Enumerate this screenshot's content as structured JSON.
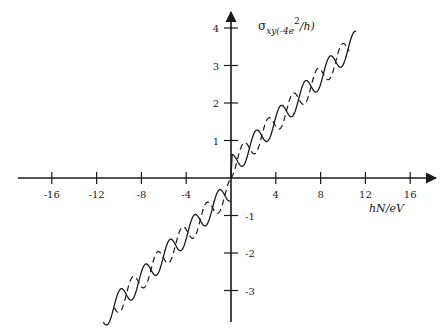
{
  "chart_data": {
    "type": "line",
    "title": "",
    "xlabel": "hN/eV",
    "ylabel": "σxy(-4e²/h)",
    "ylabel_parts": {
      "sigma": "σ",
      "sub": "xy(-4e",
      "sup": "2",
      "tail": "/h)"
    },
    "xlim": [
      -19,
      19
    ],
    "ylim": [
      -3.5,
      4.3
    ],
    "x_ticks": [
      -16,
      -12,
      -8,
      -4,
      4,
      8,
      12,
      16
    ],
    "x_tick_labels": [
      "-16",
      "-12",
      "-8",
      "-4",
      "4",
      "8",
      "12",
      "16"
    ],
    "y_ticks": [
      -3,
      -2,
      -1,
      1,
      2,
      3,
      4
    ],
    "y_tick_labels": [
      "-3",
      "-2",
      "-1",
      "1",
      "2",
      "3",
      "4"
    ],
    "grid": false,
    "legend": null,
    "series": [
      {
        "name": "solid",
        "style": "solid",
        "description": "Oscillating curve rising roughly linearly with slope ~0.33 per unit hN/eV, oscillation amplitude ~0.3, period ~2.2 units; odd-symmetric about origin; jumps from 0 to ~0.6 at origin then oscillates up to ~3.1 at x≈11, and down to ~-3.0 at x≈-11",
        "x": [
          0,
          0.5,
          1.5,
          2.6,
          3.7,
          4.8,
          5.9,
          7.0,
          8.1,
          9.2,
          10.3,
          11.2
        ],
        "y": [
          0.6,
          0.5,
          0.35,
          1.05,
          0.9,
          1.65,
          1.5,
          2.2,
          2.05,
          2.8,
          2.6,
          3.1
        ]
      },
      {
        "name": "dashed",
        "style": "dashed",
        "description": "Oscillating curve phase-shifted relative to the solid one, same linear trend; starts at origin and rises, ending ~3.4 at x≈10",
        "x": [
          0,
          1.2,
          2.3,
          3.4,
          4.5,
          5.6,
          6.7,
          7.8,
          8.9,
          10.0,
          11.0
        ],
        "y": [
          0,
          0.15,
          1.3,
          0.7,
          1.9,
          1.4,
          2.5,
          2.0,
          3.1,
          2.6,
          3.4
        ]
      }
    ]
  }
}
